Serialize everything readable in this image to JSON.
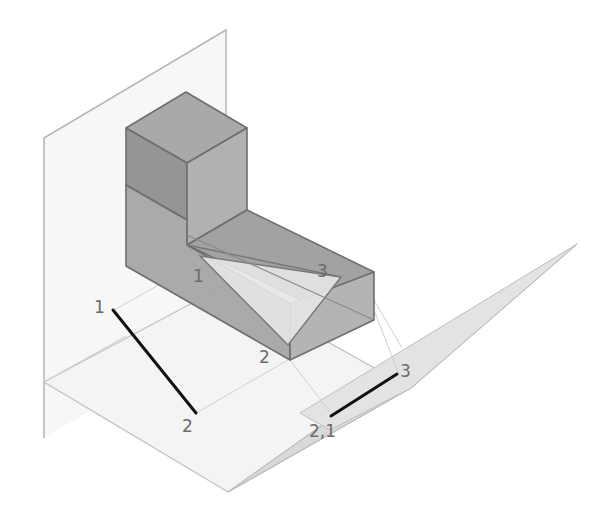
{
  "diagram": {
    "type": "isometric descriptive-geometry projection",
    "colors": {
      "background": "#ffffff",
      "plane_fill": "#ececec",
      "plane_edge": "#b3b3b3",
      "block_dark": "#8f8f8f",
      "block_mid": "#a6a6a6",
      "block_light": "#bdbdbd",
      "block_edge": "#6e6e6e",
      "triangle_fill": "#e6e6e6",
      "projection_line": "#111111",
      "label": "#6b6b6b"
    },
    "labels": {
      "triangle_p1": "1",
      "triangle_p2": "2",
      "triangle_p3": "3",
      "frontal_p1": "1",
      "frontal_p2": "2",
      "aux_p3": "3",
      "aux_p21": "2,1"
    }
  }
}
